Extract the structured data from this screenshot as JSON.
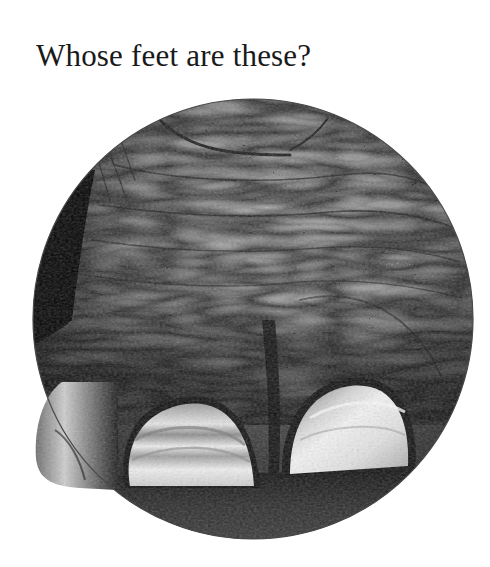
{
  "page": {
    "title": "Whose feet are these?"
  },
  "photo": {
    "subject": "elephant-foot",
    "shape": "circle",
    "center": [
      253,
      319
    ],
    "radius": 220,
    "tone": "black-and-white",
    "colors": {
      "skin_light": "#a9a9a9",
      "skin_mid": "#7a7a7a",
      "skin_dark": "#3a3a3a",
      "nail_light": "#e8e8e8",
      "shadow": "#0c0c0c",
      "ground": "#2a2a2a",
      "rim": "#4a4a4a"
    }
  }
}
